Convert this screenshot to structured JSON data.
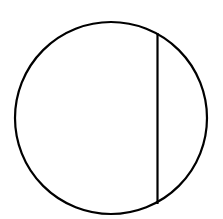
{
  "diagram": {
    "type": "geometry",
    "background": "#ffffff",
    "stroke_color": "#000000",
    "stroke_width": 2.2,
    "circle": {
      "cx": 111,
      "cy": 118,
      "r": 96
    },
    "chord": {
      "x1": 157.5,
      "y1": 33,
      "x2": 157.5,
      "y2": 204
    }
  }
}
